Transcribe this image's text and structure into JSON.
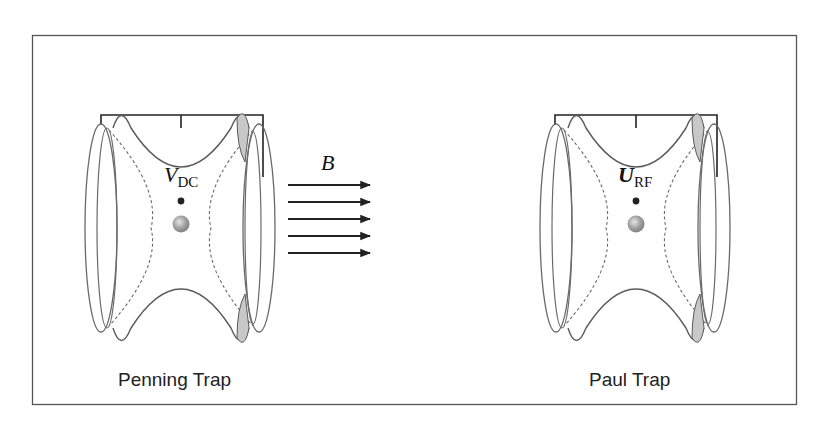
{
  "figure": {
    "frame_color": "#555555",
    "line_color": "#5a5a5a",
    "shade_color": "#c8c8c8",
    "wire_color": "#222222",
    "ion_color": "#9a9a9a"
  },
  "penning_trap": {
    "label": "Penning Trap",
    "voltage_symbol": "V",
    "voltage_subscript": "DC"
  },
  "paul_trap": {
    "label": "Paul Trap",
    "voltage_symbol": "U",
    "voltage_subscript": "RF"
  },
  "magnetic_field": {
    "symbol": "B",
    "arrow_count": 5
  }
}
